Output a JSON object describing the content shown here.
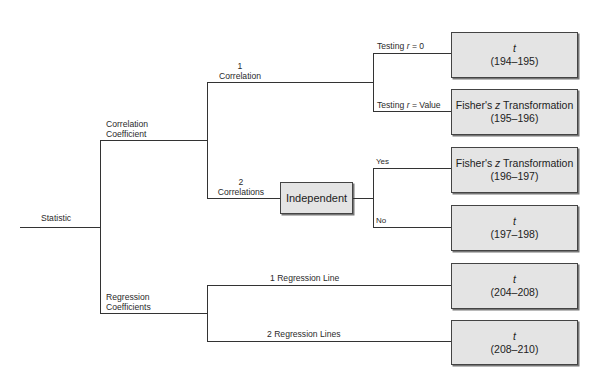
{
  "root": {
    "label": "Statistic"
  },
  "branches": {
    "correlation_coefficient": {
      "label_line1": "Correlation",
      "label_line2": "Coefficient",
      "one_correlation": {
        "label_num": "1",
        "label_text": "Correlation",
        "testing_zero": {
          "label_prefix": "Testing ",
          "label_var": "r",
          "label_suffix": " = 0"
        },
        "testing_value": {
          "label_prefix": "Testing ",
          "label_var": "r",
          "label_suffix": " = Value"
        }
      },
      "two_correlations": {
        "label_num": "2",
        "label_text": "Correlations",
        "decision": "Independent",
        "yes": "Yes",
        "no": "No"
      }
    },
    "regression_coefficients": {
      "label_line1": "Regression",
      "label_line2": "Coefficients",
      "one_line": "1 Regression Line",
      "two_lines": "2 Regression Lines"
    }
  },
  "outcomes": [
    {
      "test_prefix": "",
      "test_var": "t",
      "test_suffix": "",
      "pages": "(194–195)"
    },
    {
      "test_prefix": "Fisher's ",
      "test_var": "z",
      "test_suffix": " Transformation",
      "pages": "(195–196)"
    },
    {
      "test_prefix": "Fisher's ",
      "test_var": "z",
      "test_suffix": " Transformation",
      "pages": "(196–197)"
    },
    {
      "test_prefix": "",
      "test_var": "t",
      "test_suffix": "",
      "pages": "(197–198)"
    },
    {
      "test_prefix": "",
      "test_var": "t",
      "test_suffix": "",
      "pages": "(204–208)"
    },
    {
      "test_prefix": "",
      "test_var": "t",
      "test_suffix": "",
      "pages": "(208–210)"
    }
  ]
}
